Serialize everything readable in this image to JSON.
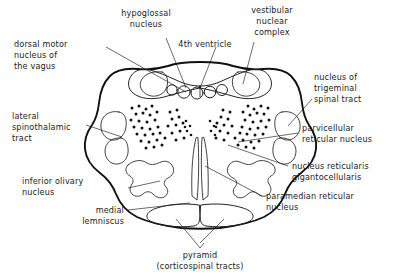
{
  "figure": {
    "ink_color": "#111111",
    "background": "#ffffff",
    "labels": {
      "hypoglossal_nucleus": {
        "line1": "hypoglossal",
        "line2": "nucleus"
      },
      "dorsal_motor_vagus": {
        "line1": "dorsal motor",
        "line2": "nucleus of",
        "line3": "the  vagus"
      },
      "fourth_ventricle": {
        "line1": "4th ventricle"
      },
      "vestibular_nuclear_complex": {
        "line1": "vestibular",
        "line2": "nuclear",
        "line3": "complex"
      },
      "trigeminal_spinal_tract": {
        "line1": "nucleus of",
        "line2": "trigeminal",
        "line3": "spinal tract"
      },
      "lateral_spinothalamic_tract": {
        "line1": "lateral",
        "line2": "spinothalamic",
        "line3": "tract"
      },
      "parvicellular_reticular_nucleus": {
        "line1": "parvicellular",
        "line2": "reticular nucleus"
      },
      "nucleus_reticularis_gigantocellularis": {
        "line1": "nucleus reticularis",
        "line2": "gigantocellularis"
      },
      "inferior_olivary_nucleus": {
        "line1": "inferior olivary",
        "line2": "nucleus"
      },
      "paramedian_reticular_nucleus": {
        "line1": "paramedian  reticular",
        "line2": "nucleus"
      },
      "medial_lemniscus": {
        "line1": "medial",
        "line2": "lemniscus"
      },
      "pyramid": {
        "line1": "pyramid",
        "line2": "(corticospinal tracts)"
      }
    }
  }
}
